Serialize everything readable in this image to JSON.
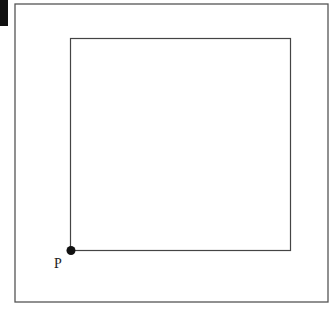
{
  "diagram": {
    "outer_frame": {
      "x": 15,
      "y": 4,
      "width": 313,
      "height": 298,
      "stroke": "#555555"
    },
    "inner_square": {
      "x": 70,
      "y": 38,
      "width": 221,
      "height": 213,
      "stroke": "#444444"
    },
    "point": {
      "label": "P",
      "cx": 71,
      "cy": 250,
      "r": 4.5,
      "fill": "#111111"
    },
    "corner_marker_color": "#111111"
  }
}
